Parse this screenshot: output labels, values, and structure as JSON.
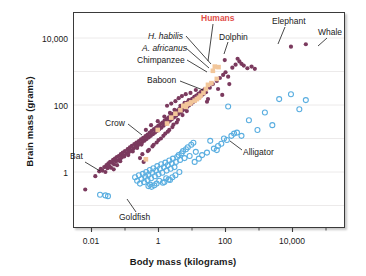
{
  "chart_data": {
    "type": "scatter",
    "title": "",
    "xlabel": "Body mass (kilograms)",
    "ylabel": "Brain mass (grams)",
    "xscale": "log",
    "yscale": "log",
    "xlim": [
      0.004,
      60000
    ],
    "ylim": [
      0.2,
      30000
    ],
    "grid": true,
    "grid_axis": "y",
    "legend_position": "none",
    "xticks": [
      "0.01",
      "1",
      "100",
      "10,000"
    ],
    "xtick_values": [
      0.01,
      1,
      100,
      10000
    ],
    "yticks": [
      "1",
      "100",
      "10,000"
    ],
    "ytick_values": [
      1,
      100,
      10000
    ],
    "colors": {
      "mammals_birds": "#7b3a5e",
      "fish_reptiles": "#5aaee0",
      "primates": "#f2c69a",
      "humans_label": "#e2504a",
      "frame": "#3a3a3a",
      "gridline": "#eceaea",
      "text": "#1a1a1a"
    },
    "series": [
      {
        "name": "mammals-and-birds",
        "marker": "filled-circle",
        "color": "#7b3a5e",
        "points": [
          [
            0.0065,
            0.3
          ],
          [
            0.013,
            0.75
          ],
          [
            0.017,
            1.05
          ],
          [
            0.019,
            1.25
          ],
          [
            0.021,
            1.1
          ],
          [
            0.024,
            1.4
          ],
          [
            0.026,
            1.0
          ],
          [
            0.028,
            1.6
          ],
          [
            0.03,
            1.3
          ],
          [
            0.032,
            1.8
          ],
          [
            0.034,
            1.5
          ],
          [
            0.036,
            2.0
          ],
          [
            0.038,
            1.35
          ],
          [
            0.041,
            1.9
          ],
          [
            0.044,
            2.3
          ],
          [
            0.047,
            1.7
          ],
          [
            0.05,
            2.5
          ],
          [
            0.053,
            2.1
          ],
          [
            0.057,
            2.8
          ],
          [
            0.06,
            2.2
          ],
          [
            0.065,
            3.0
          ],
          [
            0.07,
            2.4
          ],
          [
            0.075,
            3.4
          ],
          [
            0.08,
            2.7
          ],
          [
            0.086,
            3.8
          ],
          [
            0.092,
            3.1
          ],
          [
            0.1,
            4.2
          ],
          [
            0.11,
            3.5
          ],
          [
            0.12,
            4.8
          ],
          [
            0.13,
            3.9
          ],
          [
            0.14,
            5.4
          ],
          [
            0.15,
            4.4
          ],
          [
            0.16,
            6.0
          ],
          [
            0.18,
            5.0
          ],
          [
            0.19,
            6.8
          ],
          [
            0.21,
            5.6
          ],
          [
            0.22,
            7.5
          ],
          [
            0.24,
            6.2
          ],
          [
            0.26,
            8.4
          ],
          [
            0.28,
            7.0
          ],
          [
            0.3,
            9.4
          ],
          [
            0.33,
            7.8
          ],
          [
            0.35,
            10.5
          ],
          [
            0.38,
            8.6
          ],
          [
            0.41,
            11.8
          ],
          [
            0.44,
            9.6
          ],
          [
            0.47,
            13
          ],
          [
            0.51,
            10.8
          ],
          [
            0.55,
            15
          ],
          [
            0.59,
            12
          ],
          [
            0.63,
            17
          ],
          [
            0.68,
            13.5
          ],
          [
            0.73,
            19
          ],
          [
            0.79,
            15
          ],
          [
            0.85,
            21
          ],
          [
            0.91,
            17
          ],
          [
            0.98,
            24
          ],
          [
            1.05,
            19
          ],
          [
            1.13,
            27
          ],
          [
            1.22,
            21
          ],
          [
            1.31,
            30
          ],
          [
            1.41,
            24
          ],
          [
            1.52,
            34
          ],
          [
            1.63,
            27
          ],
          [
            1.76,
            38
          ],
          [
            1.89,
            30
          ],
          [
            2.03,
            43
          ],
          [
            2.19,
            34
          ],
          [
            2.35,
            48
          ],
          [
            2.53,
            38
          ],
          [
            2.72,
            54
          ],
          [
            2.92,
            43
          ],
          [
            3.14,
            61
          ],
          [
            3.38,
            48
          ],
          [
            3.64,
            68
          ],
          [
            3.91,
            54
          ],
          [
            4.21,
            77
          ],
          [
            4.52,
            61
          ],
          [
            4.86,
            86
          ],
          [
            5.23,
            68
          ],
          [
            5.62,
            97
          ],
          [
            6.05,
            77
          ],
          [
            6.5,
            108
          ],
          [
            7.0,
            86
          ],
          [
            7.5,
            122
          ],
          [
            8.1,
            97
          ],
          [
            8.7,
            136
          ],
          [
            9.4,
            108
          ],
          [
            10.1,
            153
          ],
          [
            10.8,
            122
          ],
          [
            11.7,
            171
          ],
          [
            12.5,
            136
          ],
          [
            13.5,
            192
          ],
          [
            14.5,
            153
          ],
          [
            15.6,
            215
          ],
          [
            16.8,
            171
          ],
          [
            18.0,
            241
          ],
          [
            19.4,
            192
          ],
          [
            20.8,
            270
          ],
          [
            22.4,
            215
          ],
          [
            24.1,
            300
          ],
          [
            26.0,
            240
          ],
          [
            28.0,
            125
          ],
          [
            30.0,
            150
          ],
          [
            0.36,
            2.0
          ],
          [
            0.52,
            4.6
          ],
          [
            0.72,
            6.5
          ],
          [
            1.0,
            9.0
          ],
          [
            1.4,
            12
          ],
          [
            1.9,
            16
          ],
          [
            2.6,
            22
          ],
          [
            3.5,
            30
          ],
          [
            0.42,
            18
          ],
          [
            0.6,
            25
          ],
          [
            0.95,
            33
          ],
          [
            1.5,
            45
          ],
          [
            2.2,
            58
          ],
          [
            3.0,
            72
          ],
          [
            4.5,
            95
          ],
          [
            6.0,
            115
          ],
          [
            8.0,
            140
          ],
          [
            12.0,
            175
          ],
          [
            16.0,
            210
          ],
          [
            22.0,
            250
          ],
          [
            34,
            330
          ],
          [
            42,
            420
          ],
          [
            55,
            520
          ],
          [
            68,
            640
          ],
          [
            85,
            790
          ],
          [
            100,
            950
          ],
          [
            130,
            420
          ],
          [
            160,
            1300
          ],
          [
            200,
            1600
          ],
          [
            230,
            2400
          ],
          [
            260,
            2000
          ],
          [
            300,
            1700
          ],
          [
            350,
            1500
          ],
          [
            450,
            1250
          ],
          [
            600,
            1400
          ],
          [
            750,
            1200
          ],
          [
            60,
            300
          ],
          [
            80,
            200
          ],
          [
            95,
            2200
          ],
          [
            120,
            700
          ],
          [
            1.8,
            95
          ],
          [
            2.4,
            110
          ],
          [
            3.2,
            130
          ],
          [
            4.0,
            160
          ],
          [
            5.0,
            185
          ],
          [
            6.5,
            210
          ],
          [
            9.0,
            230
          ],
          [
            13,
            280
          ],
          [
            0.28,
            2.6
          ],
          [
            0.33,
            3.4
          ],
          [
            0.48,
            4.2
          ],
          [
            0.66,
            5.8
          ],
          [
            0.88,
            7.6
          ],
          [
            1.18,
            10
          ],
          [
            1.6,
            14
          ],
          [
            2.1,
            18
          ],
          [
            2.8,
            26
          ],
          [
            3.8,
            36
          ],
          [
            5.2,
            50
          ],
          [
            7.0,
            66
          ],
          [
            0.046,
            1.2
          ],
          [
            0.058,
            1.6
          ],
          [
            0.072,
            2.1
          ],
          [
            0.095,
            2.9
          ],
          [
            0.125,
            3.2
          ],
          [
            0.17,
            4.1
          ],
          [
            0.23,
            5.2
          ],
          [
            0.31,
            6.6
          ],
          [
            9000,
            5500
          ],
          [
            25000,
            6500
          ]
        ]
      },
      {
        "name": "fish-reptiles-amphibians",
        "marker": "open-circle",
        "color": "#5aaee0",
        "points": [
          [
            0.018,
            0.21
          ],
          [
            0.026,
            0.2
          ],
          [
            0.031,
            0.19
          ],
          [
            0.2,
            0.7
          ],
          [
            0.23,
            0.55
          ],
          [
            0.26,
            0.8
          ],
          [
            0.28,
            0.45
          ],
          [
            0.31,
            0.62
          ],
          [
            0.34,
            0.88
          ],
          [
            0.37,
            0.5
          ],
          [
            0.4,
            0.72
          ],
          [
            0.43,
            1.0
          ],
          [
            0.47,
            0.58
          ],
          [
            0.5,
            0.82
          ],
          [
            0.55,
            1.15
          ],
          [
            0.6,
            0.65
          ],
          [
            0.65,
            0.95
          ],
          [
            0.7,
            1.3
          ],
          [
            0.78,
            0.75
          ],
          [
            0.85,
            1.1
          ],
          [
            0.92,
            1.5
          ],
          [
            1.0,
            0.85
          ],
          [
            1.1,
            1.25
          ],
          [
            1.2,
            1.7
          ],
          [
            1.3,
            0.95
          ],
          [
            1.45,
            1.4
          ],
          [
            1.6,
            1.9
          ],
          [
            1.75,
            1.1
          ],
          [
            1.9,
            1.6
          ],
          [
            2.1,
            2.2
          ],
          [
            2.3,
            1.25
          ],
          [
            2.5,
            1.8
          ],
          [
            2.7,
            2.5
          ],
          [
            3.0,
            1.4
          ],
          [
            3.3,
            2.0
          ],
          [
            3.6,
            2.8
          ],
          [
            4.0,
            3.2
          ],
          [
            4.4,
            2.3
          ],
          [
            4.9,
            3.6
          ],
          [
            5.4,
            4.2
          ],
          [
            6.0,
            2.6
          ],
          [
            6.6,
            4.8
          ],
          [
            7.5,
            5.5
          ],
          [
            8.5,
            3.0
          ],
          [
            9.5,
            6.5
          ],
          [
            11,
            7.5
          ],
          [
            13,
            4.0
          ],
          [
            1.5,
            0.5
          ],
          [
            2.0,
            0.6
          ],
          [
            2.6,
            0.7
          ],
          [
            0.5,
            0.38
          ],
          [
            0.56,
            0.42
          ],
          [
            0.62,
            0.36
          ],
          [
            20,
            3.2
          ],
          [
            35,
            8.5
          ],
          [
            55,
            4.5
          ],
          [
            90,
            10
          ],
          [
            120,
            90
          ],
          [
            150,
            12
          ],
          [
            180,
            14
          ],
          [
            220,
            15
          ],
          [
            300,
            12
          ],
          [
            500,
            35
          ],
          [
            900,
            18
          ],
          [
            1500,
            60
          ],
          [
            2500,
            25
          ],
          [
            4000,
            150
          ],
          [
            9000,
            210
          ],
          [
            16000,
            75
          ],
          [
            25000,
            140
          ],
          [
            60,
            6.0
          ],
          [
            75,
            7.0
          ],
          [
            110,
            9.0
          ],
          [
            1.05,
            0.55
          ],
          [
            1.35,
            0.48
          ],
          [
            1.7,
            0.65
          ],
          [
            2.2,
            0.58
          ],
          [
            0.75,
            0.4
          ],
          [
            0.88,
            0.45
          ],
          [
            3.2,
            0.8
          ],
          [
            4.2,
            1.0
          ],
          [
            12,
            2.0
          ],
          [
            16,
            2.5
          ],
          [
            28,
            3.8
          ],
          [
            45,
            5.0
          ]
        ]
      },
      {
        "name": "primates-and-hominins",
        "marker": "filled-square",
        "color": "#f2c69a",
        "points": [
          [
            0.42,
            2.4
          ],
          [
            0.95,
            18
          ],
          [
            1.8,
            28
          ],
          [
            2.4,
            42
          ],
          [
            3.2,
            55
          ],
          [
            4.5,
            70
          ],
          [
            5.5,
            95
          ],
          [
            7.0,
            105
          ],
          [
            9.5,
            120
          ],
          [
            12,
            135
          ],
          [
            16,
            165
          ],
          [
            22,
            230
          ],
          [
            30,
            400
          ],
          [
            38,
            450
          ],
          [
            42,
            1050
          ],
          [
            48,
            1400
          ],
          [
            55,
            600
          ],
          [
            6.5,
            88
          ],
          [
            8.5,
            110
          ],
          [
            14,
            150
          ],
          [
            18,
            190
          ],
          [
            26,
            300
          ]
        ]
      },
      {
        "name": "humans",
        "marker": "filled-square",
        "color": "#f2c69a",
        "points": [
          [
            62,
            1350
          ]
        ]
      }
    ],
    "annotations": [
      {
        "label": "Humans",
        "style": "bold-red"
      },
      {
        "label": "H. habilis",
        "style": "italic"
      },
      {
        "label": "A. africanus",
        "style": "italic"
      },
      {
        "label": "Chimpanzee",
        "style": "plain"
      },
      {
        "label": "Baboon",
        "style": "plain"
      },
      {
        "label": "Dolphin",
        "style": "plain"
      },
      {
        "label": "Elephant",
        "style": "plain"
      },
      {
        "label": "Whale",
        "style": "plain"
      },
      {
        "label": "Crow",
        "style": "plain"
      },
      {
        "label": "Bat",
        "style": "plain"
      },
      {
        "label": "Goldfish",
        "style": "plain"
      },
      {
        "label": "Alligator",
        "style": "plain"
      }
    ]
  }
}
